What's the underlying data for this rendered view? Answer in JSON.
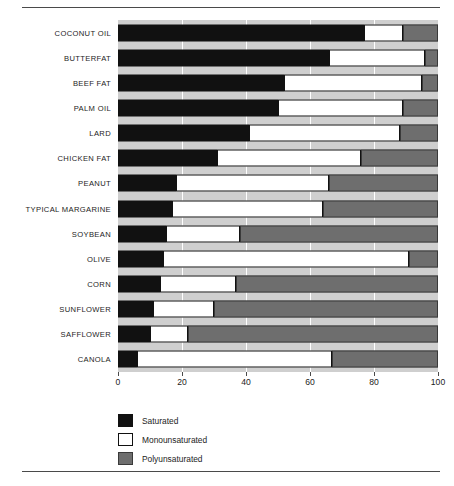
{
  "chart_data": {
    "type": "bar",
    "subtype": "stacked-horizontal-100pct",
    "title": "",
    "xlabel": "",
    "ylabel": "",
    "xlim": [
      0,
      100
    ],
    "xticks": [
      0,
      20,
      40,
      60,
      80,
      100
    ],
    "xtick_labels": [
      "0",
      "20",
      "40",
      "60",
      "80",
      "100"
    ],
    "grid": "vertical-white-gridlines",
    "legend_position": "below-plot-left",
    "categories": [
      "COCONUT OIL",
      "BUTTERFAT",
      "BEEF FAT",
      "PALM OIL",
      "LARD",
      "CHICKEN FAT",
      "PEANUT",
      "TYPICAL MARGARINE",
      "SOYBEAN",
      "OLIVE",
      "CORN",
      "SUNFLOWER",
      "SAFFLOWER",
      "CANOLA"
    ],
    "series": [
      {
        "name": "Saturated",
        "color": "#111111",
        "values": [
          77,
          66,
          52,
          50,
          41,
          31,
          18,
          17,
          15,
          14,
          13,
          11,
          10,
          6
        ]
      },
      {
        "name": "Monounsaturated",
        "color": "#ffffff",
        "values": [
          12,
          30,
          43,
          39,
          47,
          45,
          48,
          47,
          23,
          77,
          24,
          19,
          12,
          61
        ]
      },
      {
        "name": "Polyunsaturated",
        "color": "#6e6e6e",
        "values": [
          11,
          4,
          5,
          11,
          12,
          24,
          34,
          36,
          62,
          9,
          63,
          70,
          78,
          33
        ]
      }
    ]
  },
  "legend": {
    "items": [
      {
        "label": "Saturated",
        "color": "#111111"
      },
      {
        "label": "Monounsaturated",
        "color": "#ffffff"
      },
      {
        "label": "Polyunsaturated",
        "color": "#6e6e6e"
      }
    ]
  }
}
